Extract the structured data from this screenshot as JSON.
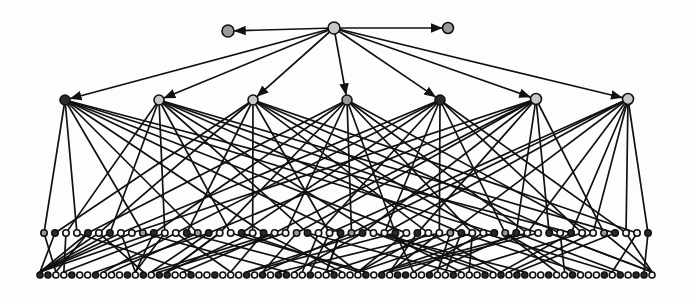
{
  "diagram": {
    "type": "hierarchical-network",
    "width": 689,
    "height": 301,
    "background": "#fdfdfd",
    "colors": {
      "edge": "#111111",
      "node_stroke": "#111111",
      "light": "#c8c8c8",
      "mid": "#9a9a9a",
      "dark": "#2a2a2a",
      "white": "#f4f4f4"
    },
    "root": {
      "x": 334,
      "y": 28,
      "r": 6,
      "fill": "light"
    },
    "side_nodes": [
      {
        "x": 228,
        "y": 31,
        "r": 6,
        "fill": "mid"
      },
      {
        "x": 448,
        "y": 28,
        "r": 5.5,
        "fill": "mid"
      }
    ],
    "level1": [
      {
        "x": 65,
        "y": 100,
        "r": 5,
        "fill": "dark"
      },
      {
        "x": 159,
        "y": 100,
        "r": 5,
        "fill": "light"
      },
      {
        "x": 253,
        "y": 100,
        "r": 5,
        "fill": "light"
      },
      {
        "x": 347,
        "y": 100,
        "r": 5,
        "fill": "mid"
      },
      {
        "x": 440,
        "y": 100,
        "r": 5,
        "fill": "dark"
      },
      {
        "x": 536,
        "y": 99,
        "r": 5.5,
        "fill": "light"
      },
      {
        "x": 628,
        "y": 99,
        "r": 5.5,
        "fill": "light"
      }
    ],
    "level2": {
      "y": 233,
      "x_start": 44,
      "x_end": 648,
      "count": 56,
      "r": 3.2
    },
    "level3": {
      "y": 275,
      "x_start": 40,
      "x_end": 652,
      "count": 78,
      "r": 3.0
    },
    "level2_fill_pattern": [
      "mid",
      "dark",
      "white",
      "white",
      "dark",
      "white",
      "dark",
      "white",
      "white",
      "mid",
      "dark",
      "white",
      "white",
      "dark"
    ],
    "level3_fill_pattern": [
      "dark",
      "dark",
      "white",
      "white",
      "dark",
      "white",
      "white",
      "dark",
      "white",
      "white",
      "white",
      "dark",
      "white",
      "dark",
      "white"
    ],
    "level1_to_level2": [
      [
        0,
        3,
        9,
        14,
        20,
        27,
        33,
        41,
        48
      ],
      [
        2,
        6,
        11,
        17,
        24,
        30,
        38,
        45,
        52
      ],
      [
        1,
        5,
        13,
        19,
        26,
        35,
        40,
        47,
        54
      ],
      [
        4,
        10,
        16,
        22,
        28,
        32,
        39,
        44,
        50
      ],
      [
        7,
        12,
        18,
        25,
        31,
        36,
        42,
        49,
        53
      ],
      [
        8,
        15,
        21,
        23,
        29,
        34,
        43,
        46,
        51
      ],
      [
        26,
        28,
        31,
        37,
        44,
        48,
        50,
        53,
        55
      ]
    ],
    "level2_to_level3": "computed"
  }
}
